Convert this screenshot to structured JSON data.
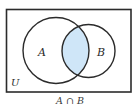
{
  "diagram": {
    "type": "venn",
    "universe": {
      "label": "U",
      "x": 6,
      "y": 9,
      "width": 125,
      "height": 83
    },
    "sets": [
      {
        "label": "A",
        "cx": 56,
        "cy": 50.5,
        "r": 33,
        "label_x": 42,
        "label_y": 55
      },
      {
        "label": "B",
        "cx": 88.5,
        "cy": 51,
        "r": 26.5,
        "label_x": 100,
        "label_y": 55
      }
    ],
    "highlighted_region": "A ∩ B",
    "caption": "A ∩ B",
    "colors": {
      "stroke": "#2b2b2b",
      "highlight_fill": "#cfe6f8",
      "background": "#ffffff"
    }
  }
}
